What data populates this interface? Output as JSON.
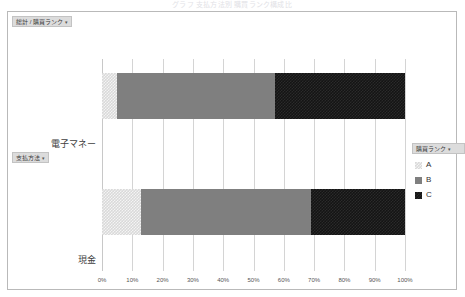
{
  "top_caption": "グラフ  支払方法別 購買ランク構成比",
  "field_buttons": {
    "top": "総計 / 購買ランク",
    "top_caret": "▾",
    "left": "支払方法",
    "left_caret": "▾"
  },
  "legend": {
    "title": "購買ランク",
    "caret": "▾",
    "items": [
      {
        "label": "A",
        "swatch": "series-a-swatch"
      },
      {
        "label": "B",
        "swatch": "series-b-swatch"
      },
      {
        "label": "C",
        "swatch": "series-c-swatch"
      }
    ]
  },
  "colors": {
    "series_a": "#d9d9d9",
    "series_b": "#7f7f7f",
    "series_c": "#141414",
    "gridline": "#d4d4d4",
    "frame": "#b9b9b9",
    "field_button_bg": "#dcdcdc"
  },
  "chart_data": {
    "type": "bar",
    "orientation": "horizontal",
    "stacked": true,
    "stack_mode": "100%",
    "title": "",
    "subtitle": "",
    "xlabel": "",
    "ylabel": "",
    "categories": [
      "電子マネー",
      "現金"
    ],
    "series": [
      {
        "name": "A",
        "values": [
          5,
          13
        ]
      },
      {
        "name": "B",
        "values": [
          52,
          56
        ]
      },
      {
        "name": "C",
        "values": [
          43,
          31
        ]
      }
    ],
    "xlim": [
      0,
      100
    ],
    "xticks": [
      0,
      10,
      20,
      30,
      40,
      50,
      60,
      70,
      80,
      90,
      100
    ],
    "xtick_labels": [
      "0%",
      "10%",
      "20%",
      "30%",
      "40%",
      "50%",
      "60%",
      "70%",
      "80%",
      "90%",
      "100%"
    ],
    "grid": true,
    "grid_axis": "x",
    "legend_position": "right",
    "legend_entries": [
      "A",
      "B",
      "C"
    ]
  }
}
